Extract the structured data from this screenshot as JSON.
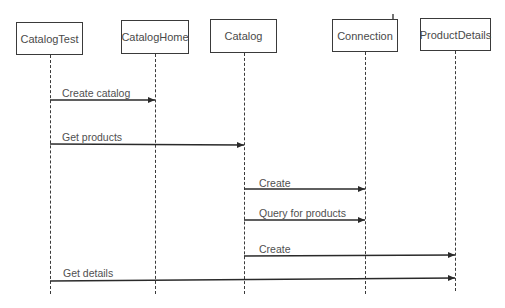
{
  "diagram": {
    "type": "sequence",
    "participants": [
      {
        "id": "catalogtest",
        "label": "CatalogTest",
        "x": 16,
        "y": 22,
        "w": 67,
        "h": 33,
        "lifeline_x": 50
      },
      {
        "id": "cataloghome",
        "label": "CatalogHome",
        "x": 121,
        "y": 20,
        "w": 68,
        "h": 34,
        "lifeline_x": 155
      },
      {
        "id": "catalog",
        "label": "Catalog",
        "x": 210,
        "y": 19,
        "w": 67,
        "h": 34,
        "lifeline_x": 244
      },
      {
        "id": "connection",
        "label": "Connection",
        "x": 332,
        "y": 19,
        "w": 66,
        "h": 33,
        "lifeline_x": 365
      },
      {
        "id": "productdetails",
        "label": "ProductDetails",
        "x": 420,
        "y": 18,
        "w": 71,
        "h": 33,
        "lifeline_x": 455
      }
    ],
    "lifeline_end_y": 294,
    "messages": [
      {
        "label": "Create catalog",
        "from": "CatalogTest",
        "to": "CatalogHome",
        "y": 100
      },
      {
        "label": "Get products",
        "from": "CatalogTest",
        "to": "Catalog",
        "y": 144
      },
      {
        "label": "Create",
        "from": "Catalog",
        "to": "Connection",
        "y": 189
      },
      {
        "label": "Query for products",
        "from": "Catalog",
        "to": "Connection",
        "y": 220
      },
      {
        "label": "Create",
        "from": "Catalog",
        "to": "ProductDetails",
        "y": 256
      },
      {
        "label": "Get details",
        "from": "CatalogTest",
        "to": "ProductDetails",
        "y": 280
      }
    ],
    "colors": {
      "line": "#3a3a3a",
      "text": "#4a4a4a",
      "background": "#ffffff"
    }
  }
}
